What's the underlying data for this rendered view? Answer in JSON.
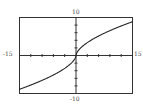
{
  "chart_data": {
    "type": "line",
    "title": "",
    "xlabel": "",
    "ylabel": "",
    "xlim": [
      -15,
      15
    ],
    "ylim": [
      -10,
      10
    ],
    "xscale": 3,
    "yscale": 2,
    "grid": false,
    "legend": null,
    "tick_labels": {
      "xmin": "-15",
      "xmax": "15",
      "ymin": "-10",
      "ymax": "10"
    },
    "series": [
      {
        "name": "f(x)",
        "description": "odd function, vertical tangent at origin, approx y = sign(x)*1.75*|x|^0.6",
        "x": [
          -15,
          -12,
          -9,
          -6,
          -3,
          -1,
          -0.2,
          0,
          0.2,
          1,
          3,
          6,
          9,
          12,
          15
        ],
        "y": [
          -8.9,
          -7.8,
          -6.6,
          -5.1,
          -3.4,
          -1.75,
          -0.66,
          0,
          0.66,
          1.75,
          3.4,
          5.1,
          6.6,
          7.8,
          8.9
        ]
      }
    ]
  },
  "colors": {
    "frame": "#333333",
    "axis": "#333333",
    "curve": "#222222",
    "background": "#ffffff"
  }
}
